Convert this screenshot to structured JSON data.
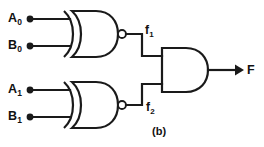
{
  "figure": {
    "caption": "(b)"
  },
  "inputs": [
    {
      "id": "A0",
      "base": "A",
      "sub": "0",
      "dot": "input-terminal-dot"
    },
    {
      "id": "B0",
      "base": "B",
      "sub": "0",
      "dot": "input-terminal-dot"
    },
    {
      "id": "A1",
      "base": "A",
      "sub": "1",
      "dot": "input-terminal-dot"
    },
    {
      "id": "B1",
      "base": "B",
      "sub": "1",
      "dot": "input-terminal-dot"
    }
  ],
  "intermediate": [
    {
      "id": "f1",
      "base": "f",
      "sub": "1"
    },
    {
      "id": "f2",
      "base": "f",
      "sub": "2"
    }
  ],
  "output": {
    "id": "F",
    "label": "F"
  },
  "gates": [
    {
      "id": "gate-xnor-top",
      "type": "XNOR",
      "inputs": [
        "A0",
        "B0"
      ],
      "output": "f1"
    },
    {
      "id": "gate-xnor-bottom",
      "type": "XNOR",
      "inputs": [
        "A1",
        "B1"
      ],
      "output": "f2"
    },
    {
      "id": "gate-and",
      "type": "AND",
      "inputs": [
        "f1",
        "f2"
      ],
      "output": "F"
    }
  ],
  "colors": {
    "line": "#1a1a1a",
    "fill": "#ffffff",
    "background": "#ffffff",
    "text": "#111111"
  }
}
